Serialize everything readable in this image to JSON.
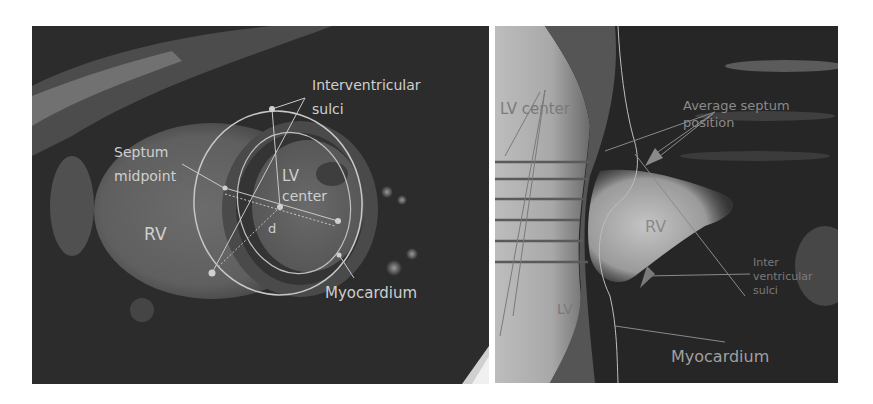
{
  "figure": {
    "left_panel": {
      "description": "Short-axis cardiac MRI slice with LV/RV annotations",
      "labels": {
        "interventricular_1": "Interventricular",
        "interventricular_2": "sulci",
        "septum_1": "Septum",
        "septum_2": "midpoint",
        "lv_1": "LV",
        "lv_2": "center",
        "d": "d",
        "rv": "RV",
        "myocardium": "Myocardium"
      }
    },
    "right_panel": {
      "description": "Reformatted long-axis view with septum position lines",
      "labels": {
        "lv_center": "LV center",
        "avg_septum_1": "Average septum",
        "avg_septum_2": "position",
        "rv": "RV",
        "inter_1": "Inter",
        "inter_2": "ventricular",
        "inter_3": "sulci",
        "lv": "LV",
        "myocardium": "Myocardium"
      },
      "horizontal_line_count": 6
    },
    "colors": {
      "annotation": "#c8c8c8",
      "dark_label": "#6e6e6e",
      "line_dark": "#555555"
    }
  }
}
